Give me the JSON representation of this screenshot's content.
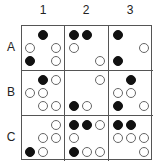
{
  "columns": [
    "1",
    "2",
    "3"
  ],
  "rows": [
    "A",
    "B",
    "C"
  ],
  "legend_symbols": {
    "filled": "filled-circle",
    "open": "open-circle"
  },
  "colors": {
    "grid_line": "#555555",
    "filled": "#111111",
    "open_stroke": "#666666",
    "background": "#ffffff"
  },
  "cells": {
    "A1": [
      [
        "",
        "filled",
        ""
      ],
      [
        "open",
        "",
        "open"
      ],
      [
        "filled",
        "",
        "open"
      ]
    ],
    "A2": [
      [
        "filled",
        "filled",
        ""
      ],
      [
        "open",
        "",
        ""
      ],
      [
        "",
        "",
        "open"
      ]
    ],
    "A3": [
      [
        "filled",
        "",
        ""
      ],
      [
        "",
        "",
        "open"
      ],
      [
        "filled",
        "",
        ""
      ]
    ],
    "B1": [
      [
        "",
        "filled",
        "open"
      ],
      [
        "open",
        "open",
        ""
      ],
      [
        "",
        "open",
        "open"
      ]
    ],
    "B2": [
      [
        "",
        "",
        "open"
      ],
      [
        "",
        "",
        ""
      ],
      [
        "filled",
        "open",
        ""
      ]
    ],
    "B3": [
      [
        "",
        "filled",
        ""
      ],
      [
        "open",
        "open",
        ""
      ],
      [
        "filled",
        "",
        "open"
      ]
    ],
    "C1": [
      [
        "",
        "",
        "open"
      ],
      [
        "",
        "open",
        "open"
      ],
      [
        "filled",
        "open",
        ""
      ]
    ],
    "C2": [
      [
        "filled",
        "filled",
        "open"
      ],
      [
        "open",
        "",
        ""
      ],
      [
        "filled",
        "open",
        "open"
      ]
    ],
    "C3": [
      [
        "filled",
        "filled",
        ""
      ],
      [
        "open",
        "open",
        "open"
      ],
      [
        "",
        "",
        "open"
      ]
    ]
  }
}
